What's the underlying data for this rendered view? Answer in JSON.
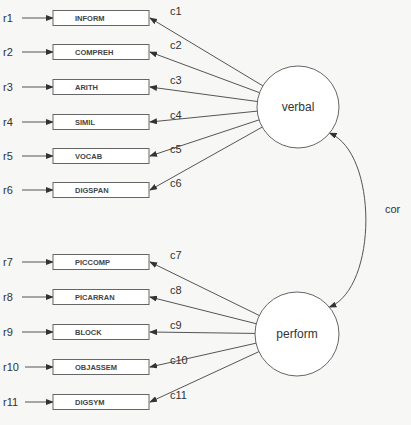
{
  "diagram": {
    "type": "path-diagram",
    "latent_factors": [
      {
        "id": "verbal",
        "label": "verbal"
      },
      {
        "id": "perform",
        "label": "perform"
      }
    ],
    "indicators": [
      {
        "label": "INFORM",
        "error": "r1",
        "loading": "c1",
        "factor": "verbal"
      },
      {
        "label": "COMPREH",
        "error": "r2",
        "loading": "c2",
        "factor": "verbal"
      },
      {
        "label": "ARITH",
        "error": "r3",
        "loading": "c3",
        "factor": "verbal"
      },
      {
        "label": "SIMIL",
        "error": "r4",
        "loading": "c4",
        "factor": "verbal"
      },
      {
        "label": "VOCAB",
        "error": "r5",
        "loading": "c5",
        "factor": "verbal"
      },
      {
        "label": "DIGSPAN",
        "error": "r6",
        "loading": "c6",
        "factor": "verbal"
      },
      {
        "label": "PICCOMP",
        "error": "r7",
        "loading": "c7",
        "factor": "perform"
      },
      {
        "label": "PICARRAN",
        "error": "r8",
        "loading": "c8",
        "factor": "perform"
      },
      {
        "label": "BLOCK",
        "error": "r9",
        "loading": "c9",
        "factor": "perform"
      },
      {
        "label": "OBJASSEM",
        "error": "r10",
        "loading": "c10",
        "factor": "perform"
      },
      {
        "label": "DIGSYM",
        "error": "r11",
        "loading": "c11",
        "factor": "perform"
      }
    ],
    "covariance": {
      "from": "verbal",
      "to": "perform",
      "label": "cor"
    }
  }
}
